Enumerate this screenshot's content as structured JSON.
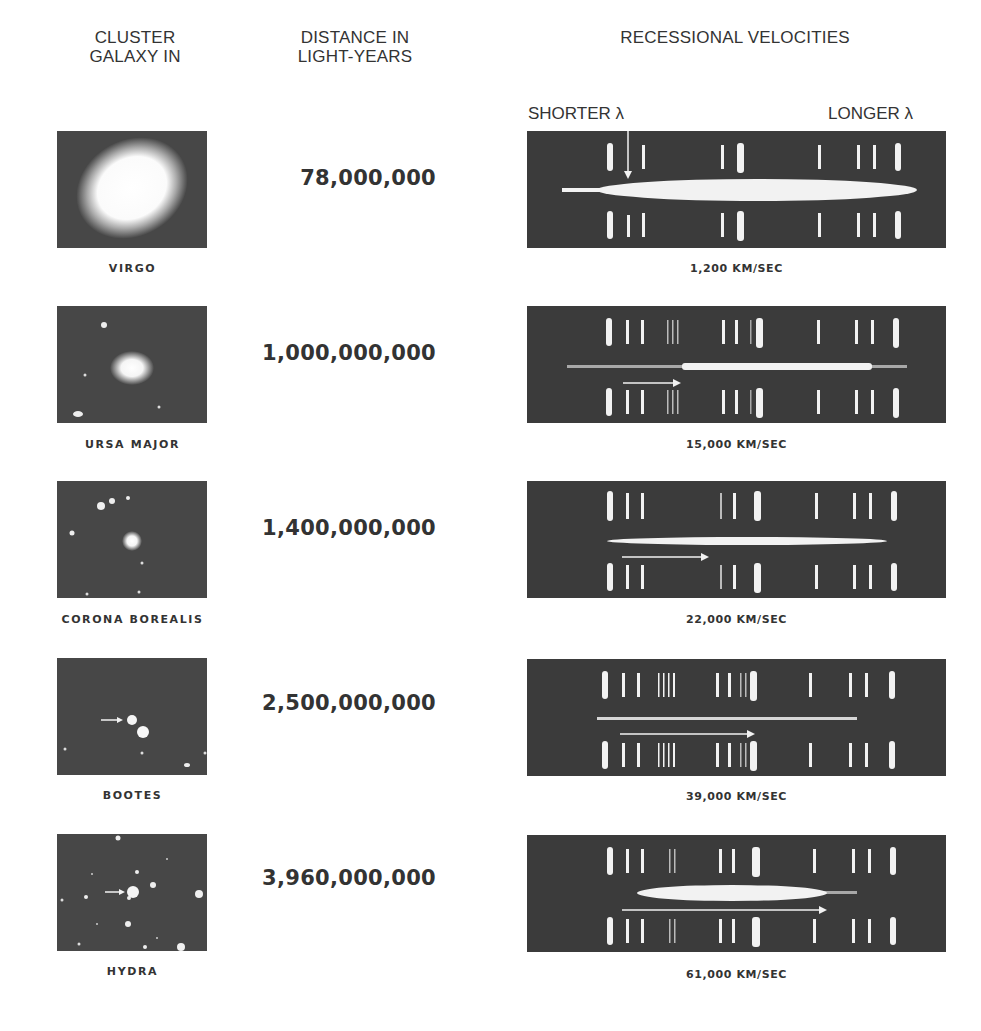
{
  "headers": {
    "col1_line1": "CLUSTER",
    "col1_line2": "GALAXY IN",
    "col2_line1": "DISTANCE IN",
    "col2_line2": "LIGHT-YEARS",
    "col3": "RECESSIONAL VELOCITIES",
    "shorter": "SHORTER λ",
    "longer": "LONGER λ"
  },
  "rows": [
    {
      "cluster": "VIRGO",
      "distance": "78,000,000",
      "velocity": "1,200 KM/SEC"
    },
    {
      "cluster": "URSA MAJOR",
      "distance": "1,000,000,000",
      "velocity": "15,000 KM/SEC"
    },
    {
      "cluster": "CORONA BOREALIS",
      "distance": "1,400,000,000",
      "velocity": "22,000 KM/SEC"
    },
    {
      "cluster": "BOOTES",
      "distance": "2,500,000,000",
      "velocity": "39,000 KM/SEC"
    },
    {
      "cluster": "HYDRA",
      "distance": "3,960,000,000",
      "velocity": "61,000 KM/SEC"
    }
  ],
  "colors": {
    "plate": "#3b3b3b",
    "galaxy_bg": "#474747",
    "text": "#333333",
    "line": "#f2f2f2"
  }
}
